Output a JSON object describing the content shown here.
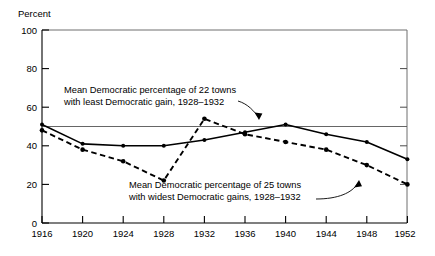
{
  "chart_data": {
    "type": "line",
    "title": "",
    "xlabel": "",
    "ylabel": "Percent",
    "xlim": [
      1916,
      1952
    ],
    "ylim": [
      0,
      100
    ],
    "grid": false,
    "legend_position": "none",
    "x": [
      1916,
      1920,
      1924,
      1928,
      1932,
      1936,
      1940,
      1944,
      1948,
      1952
    ],
    "xticklabels": [
      "1916",
      "1920",
      "1924",
      "1928",
      "1932",
      "1936",
      "1940",
      "1944",
      "1948",
      "1952"
    ],
    "yticklabels": [
      "0",
      "20",
      "40",
      "60",
      "80",
      "100"
    ],
    "yticks": [
      0,
      20,
      40,
      60,
      80,
      100
    ],
    "reference_lines": [
      {
        "name": "fifty-percent-line",
        "y": 50,
        "orientation": "horizontal"
      }
    ],
    "series": [
      {
        "name": "least-democratic-gain-22-towns",
        "style": "solid",
        "values": [
          51,
          41,
          40,
          40,
          43,
          47,
          51,
          46,
          42,
          33
        ]
      },
      {
        "name": "widest-democratic-gains-25-towns",
        "style": "dashed",
        "values": [
          48,
          38,
          32,
          22,
          54,
          46,
          42,
          38,
          30,
          20
        ]
      }
    ],
    "annotations": [
      {
        "name": "annotation-least-gain",
        "line1": "Mean Democratic percentage of 22 towns",
        "line2": "with least Democratic gain, 1928–1932"
      },
      {
        "name": "annotation-widest-gains",
        "line1": "Mean Democratic percentage of 25 towns",
        "line2": "with widest Democratic gains, 1928–1932"
      }
    ]
  }
}
